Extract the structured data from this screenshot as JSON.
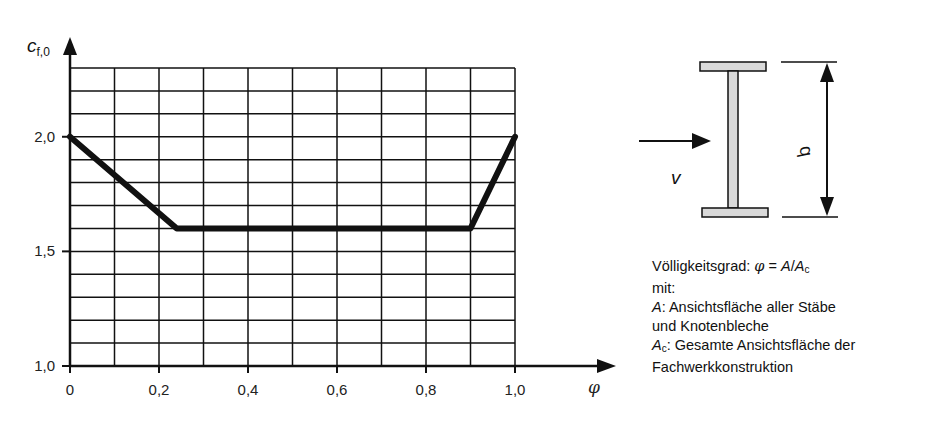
{
  "chart_data": {
    "type": "line",
    "title": "",
    "xlabel": "φ",
    "ylabel": "c_f,0",
    "xlim": [
      0,
      1.0
    ],
    "ylim": [
      1.0,
      2.3
    ],
    "x_ticks": [
      "0",
      "0,2",
      "0,4",
      "0,6",
      "0,8",
      "1,0"
    ],
    "y_ticks": [
      "1,0",
      "1,5",
      "2,0"
    ],
    "grid": true,
    "grid_x_step": 0.1,
    "grid_y_step": 0.1,
    "series": [
      {
        "name": "c_f,0",
        "x": [
          0,
          0.24,
          0.9,
          1.0
        ],
        "y": [
          2.0,
          1.6,
          1.6,
          2.0
        ]
      }
    ]
  },
  "axes": {
    "y_label_main": "c",
    "y_label_sub": "f,0",
    "x_label": "φ"
  },
  "figure": {
    "wind_label": "v",
    "dimension_label": "d"
  },
  "description": {
    "line1_prefix": "Völligkeitsgrad: ",
    "line1_phi": "φ",
    "line1_eq": " = ",
    "line1_A": "A",
    "line1_slash": "/",
    "line1_Ac": "A",
    "line1_Ac_sub": "c",
    "line2": "mit:",
    "line3_A": "A",
    "line3_text": ": Ansichtsfläche aller Stäbe",
    "line4": "und Knotenbleche",
    "line5_A": "A",
    "line5_sub": "c",
    "line5_text": ": Gesamte Ansichtsfläche der",
    "line6": "Fachwerkkonstruktion"
  },
  "colors": {
    "line": "#111111",
    "flange_fill": "#d9d9d9"
  }
}
